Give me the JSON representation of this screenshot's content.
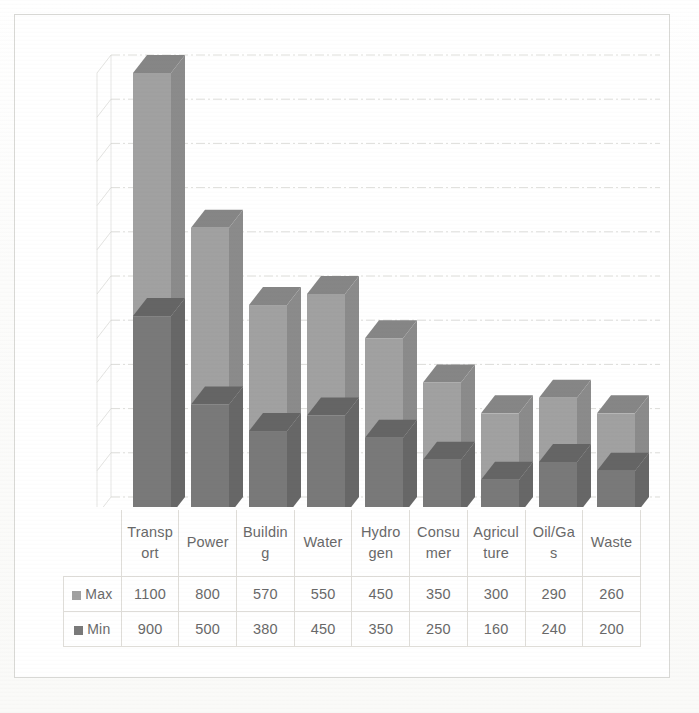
{
  "chart_data": {
    "type": "bar",
    "subtype": "stacked-3d-column",
    "title": "",
    "subtitle": "",
    "xlabel": "",
    "ylabel": "",
    "grid": true,
    "legend_position": "table-left",
    "axis_tick_labels": [],
    "ylim": [
      0,
      2000
    ],
    "gridline_interval": 200,
    "categories": [
      "Transport",
      "Power",
      "Building",
      "Water",
      "Hydrogen",
      "Consumer",
      "Agriculture",
      "Oil/Gas",
      "Waste"
    ],
    "category_display_lines": [
      [
        "Transp",
        "ort"
      ],
      [
        "Power",
        ""
      ],
      [
        "Buildin",
        "g"
      ],
      [
        "Water",
        ""
      ],
      [
        "Hydro",
        "gen"
      ],
      [
        "Consu",
        "mer"
      ],
      [
        "Agricul",
        "ture"
      ],
      [
        "Oil/Ga",
        "s"
      ],
      [
        "Waste",
        ""
      ]
    ],
    "series": [
      {
        "name": "Max",
        "color": "#9a9a9a",
        "values": [
          1100,
          800,
          570,
          550,
          450,
          350,
          300,
          290,
          260
        ]
      },
      {
        "name": "Min",
        "color": "#6f6f6f",
        "values": [
          900,
          500,
          380,
          450,
          350,
          250,
          160,
          240,
          200
        ]
      }
    ],
    "stack_order": [
      "Min",
      "Max"
    ],
    "totals": [
      2000,
      1300,
      950,
      1000,
      800,
      600,
      460,
      530,
      460
    ]
  },
  "table": {
    "legend_corner_label": "",
    "rows": [
      {
        "label": "Max",
        "swatch": "max-legend-swatch",
        "values": [
          "1100",
          "800",
          "570",
          "550",
          "450",
          "350",
          "300",
          "290",
          "260"
        ]
      },
      {
        "label": "Min",
        "swatch": "min-legend-swatch",
        "values": [
          "900",
          "500",
          "380",
          "450",
          "350",
          "250",
          "160",
          "240",
          "200"
        ]
      }
    ]
  },
  "colors": {
    "series_max": "#9a9a9a",
    "series_min": "#6f6f6f",
    "series_max_side": "#838383",
    "series_min_side": "#5c5c5c",
    "series_max_top": "#7d7d7d",
    "series_min_top": "#5a5a5a",
    "gridline": "#cfcfcb",
    "frame": "#d6d6d2",
    "table_border": "#dddbd6",
    "text": "#5d5d5d",
    "background": "#ffffff"
  }
}
